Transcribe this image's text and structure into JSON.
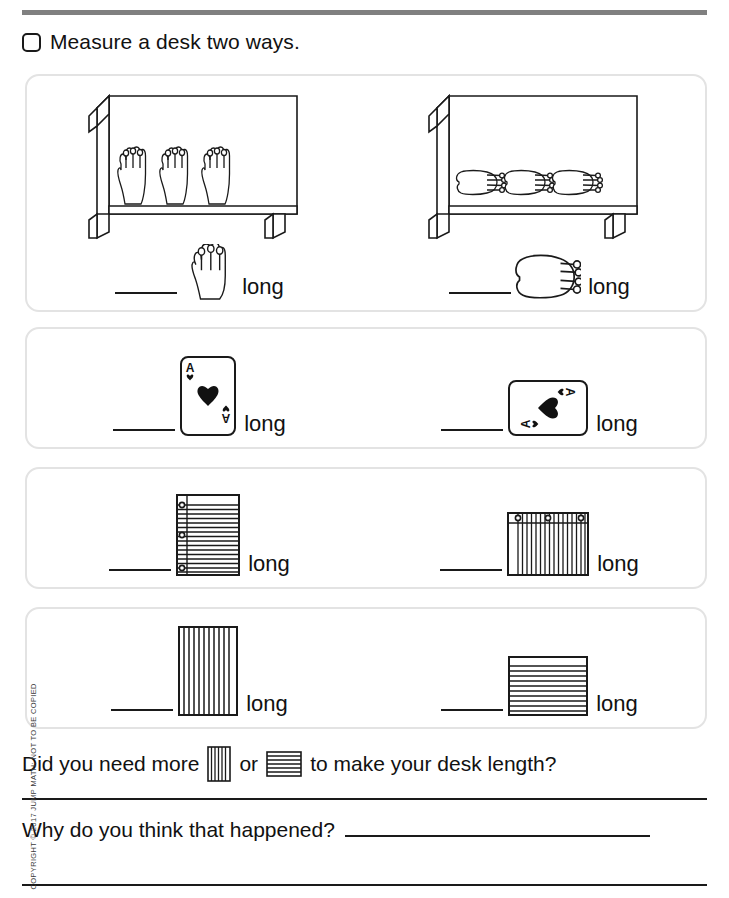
{
  "page": {
    "top_cut_text": "",
    "copyright": "COPYRIGHT © 2017 JUMP MATH: NOT TO BE COPIED"
  },
  "instruction": {
    "checkbox_state": "unchecked",
    "text": "Measure a desk two ways."
  },
  "rows": [
    {
      "id": "hands",
      "left": {
        "unit_name": "open-hand",
        "unit_count_on_desk": 3,
        "blank_value": "",
        "label": "long"
      },
      "right": {
        "unit_name": "closed-hand",
        "unit_count_on_desk": 3,
        "blank_value": "",
        "label": "long"
      }
    },
    {
      "id": "cards",
      "left": {
        "unit_name": "playing-card-portrait",
        "card_rank": "A",
        "card_suit": "heart",
        "blank_value": "",
        "label": "long"
      },
      "right": {
        "unit_name": "playing-card-landscape",
        "card_rank": "A",
        "card_suit": "heart",
        "blank_value": "",
        "label": "long"
      }
    },
    {
      "id": "paper",
      "left": {
        "unit_name": "lined-paper-portrait",
        "line_count": 18,
        "hole_count": 3,
        "blank_value": "",
        "label": "long"
      },
      "right": {
        "unit_name": "lined-paper-landscape",
        "line_count": 18,
        "hole_count": 3,
        "blank_value": "",
        "label": "long"
      }
    },
    {
      "id": "stripes",
      "left": {
        "unit_name": "vertical-striped-block",
        "stripe_count": 11,
        "blank_value": "",
        "label": "long"
      },
      "right": {
        "unit_name": "horizontal-striped-block",
        "stripe_count": 10,
        "blank_value": "",
        "label": "long"
      }
    }
  ],
  "questions": {
    "more": {
      "part1": "Did you need more",
      "part2": "or",
      "part3": "to make your desk length?",
      "icon1": "vertical-striped-block",
      "icon2": "horizontal-striped-block"
    },
    "why": {
      "text": "Why do you think that happened?",
      "answer_value": ""
    }
  },
  "colors": {
    "rule": "#808080",
    "ink": "#1a1a1a",
    "panel_border": "#e3e3e3"
  }
}
